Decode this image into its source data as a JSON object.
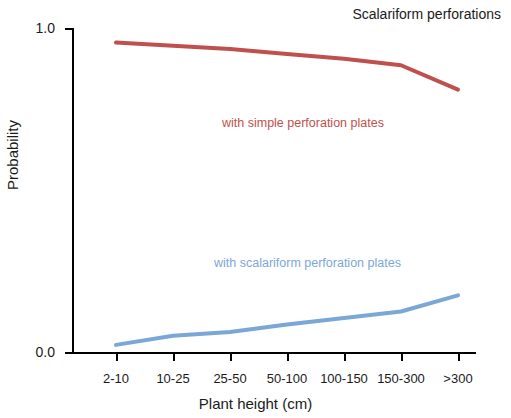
{
  "chart_data": {
    "type": "line",
    "title": "Scalariform perforations",
    "xlabel": "Plant height (cm)",
    "ylabel": "Probability",
    "categories": [
      "2-10",
      "10-25",
      "25-50",
      "50-100",
      "100-150",
      "150-300",
      ">300"
    ],
    "ylim": [
      0.0,
      1.0
    ],
    "yticks": [
      "0.0",
      "1.0"
    ],
    "ytick_values": [
      0.0,
      1.0
    ],
    "grid": false,
    "legend_position": "inline-annotations",
    "series": [
      {
        "name": "with simple perforation plates",
        "color": "#c0504d",
        "values": [
          0.955,
          0.945,
          0.935,
          0.92,
          0.905,
          0.885,
          0.81
        ],
        "annotation": "with simple perforation plates"
      },
      {
        "name": "with scalariform perforation plates",
        "color": "#7ba7d7",
        "values": [
          0.022,
          0.05,
          0.062,
          0.085,
          0.105,
          0.125,
          0.175
        ],
        "annotation": "with scalariform perforation plates"
      }
    ]
  }
}
